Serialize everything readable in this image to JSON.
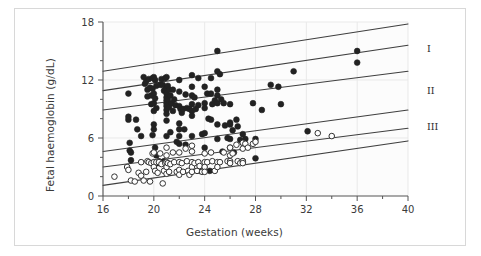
{
  "figure": {
    "border_color": "#d8d8d8",
    "plot_bg": "#fcfcfc",
    "axis_color": "#555555",
    "grid_color": "#e9e9e9",
    "line_color": "#3f3f3f",
    "filled_marker_color": "#222222",
    "open_marker_stroke": "#333333"
  },
  "chart_data": {
    "type": "scatter",
    "title": "",
    "xlabel": "Gestation (weeks)",
    "ylabel": "Fetal haemoglobin (g/dL)",
    "xlim": [
      16,
      40
    ],
    "ylim": [
      0,
      18
    ],
    "xticks": [
      16,
      20,
      24,
      28,
      32,
      36,
      40
    ],
    "xtick_labels": [
      "16",
      "20",
      "24",
      "28",
      "32",
      "36",
      "40"
    ],
    "xminor_step": 2,
    "yticks": [
      0,
      6,
      12,
      18
    ],
    "ytick_labels": [
      "0",
      "6",
      "12",
      "18"
    ],
    "yminor_step": 2,
    "grid": "faint vertical at major x ticks, faint horizontal at major y ticks",
    "legend": "none",
    "annotations": [
      {
        "text": "I",
        "x": 40,
        "y": 15.2,
        "placement": "right-outside"
      },
      {
        "text": "II",
        "x": 40,
        "y": 10.9,
        "placement": "right-outside"
      },
      {
        "text": "III",
        "x": 40,
        "y": 7.2,
        "placement": "right-outside"
      }
    ],
    "reference_lines": [
      {
        "name": "band-I-upper",
        "x1": 16,
        "y1": 12.9,
        "x2": 40,
        "y2": 17.8
      },
      {
        "name": "band-I-lower",
        "x1": 16,
        "y1": 10.9,
        "x2": 40,
        "y2": 15.6
      },
      {
        "name": "band-II-upper",
        "x1": 16,
        "y1": 8.9,
        "x2": 40,
        "y2": 12.9
      },
      {
        "name": "band-II-lower",
        "x1": 16,
        "y1": 4.6,
        "x2": 40,
        "y2": 8.9
      },
      {
        "name": "band-III-upper",
        "x1": 16,
        "y1": 3.0,
        "x2": 40,
        "y2": 7.0
      },
      {
        "name": "band-III-lower",
        "x1": 16,
        "y1": 1.1,
        "x2": 40,
        "y2": 5.7
      }
    ],
    "series": [
      {
        "name": "filled",
        "marker": "filled-circle",
        "color": "#222222",
        "points": [
          [
            18.0,
            10.6
          ],
          [
            18.0,
            7.9
          ],
          [
            18.0,
            8.2
          ],
          [
            18.1,
            5.5
          ],
          [
            18.1,
            4.7
          ],
          [
            18.2,
            4.5
          ],
          [
            18.2,
            3.7
          ],
          [
            18.6,
            7.9
          ],
          [
            18.7,
            6.9
          ],
          [
            19.0,
            6.2
          ],
          [
            19.2,
            12.3
          ],
          [
            19.3,
            11.6
          ],
          [
            19.4,
            11.9
          ],
          [
            19.5,
            11.0
          ],
          [
            19.5,
            10.3
          ],
          [
            19.6,
            12.1
          ],
          [
            19.7,
            11.2
          ],
          [
            19.8,
            10.4
          ],
          [
            19.8,
            9.5
          ],
          [
            19.9,
            12.2
          ],
          [
            19.9,
            11.1
          ],
          [
            19.9,
            6.3
          ],
          [
            20.0,
            12.3
          ],
          [
            20.0,
            10.6
          ],
          [
            20.0,
            9.6
          ],
          [
            20.0,
            8.8
          ],
          [
            20.0,
            7.4
          ],
          [
            20.0,
            6.9
          ],
          [
            20.1,
            12.0
          ],
          [
            20.1,
            10.1
          ],
          [
            20.1,
            5.0
          ],
          [
            20.2,
            11.4
          ],
          [
            20.2,
            9.1
          ],
          [
            20.2,
            4.2
          ],
          [
            20.3,
            3.4
          ],
          [
            20.4,
            3.6
          ],
          [
            20.5,
            11.5
          ],
          [
            20.5,
            3.4
          ],
          [
            20.6,
            12.1
          ],
          [
            20.7,
            11.5
          ],
          [
            20.8,
            10.9
          ],
          [
            20.8,
            3.6
          ],
          [
            20.9,
            12.2
          ],
          [
            20.9,
            11.0
          ],
          [
            21.0,
            12.3
          ],
          [
            21.0,
            11.1
          ],
          [
            21.0,
            10.6
          ],
          [
            21.0,
            10.2
          ],
          [
            21.0,
            9.9
          ],
          [
            21.0,
            9.6
          ],
          [
            21.0,
            9.3
          ],
          [
            21.0,
            8.9
          ],
          [
            21.0,
            8.5
          ],
          [
            21.0,
            7.8
          ],
          [
            21.0,
            6.2
          ],
          [
            21.1,
            11.4
          ],
          [
            21.1,
            10.0
          ],
          [
            21.2,
            11.0
          ],
          [
            21.2,
            9.2
          ],
          [
            21.3,
            10.4
          ],
          [
            21.3,
            6.6
          ],
          [
            21.4,
            9.6
          ],
          [
            21.5,
            11.0
          ],
          [
            21.5,
            8.8
          ],
          [
            21.6,
            10.0
          ],
          [
            21.7,
            9.4
          ],
          [
            21.8,
            5.6
          ],
          [
            22.0,
            12.0
          ],
          [
            22.0,
            10.8
          ],
          [
            22.0,
            9.3
          ],
          [
            22.0,
            7.5
          ],
          [
            22.0,
            6.9
          ],
          [
            22.0,
            6.2
          ],
          [
            22.0,
            5.4
          ],
          [
            22.1,
            9.0
          ],
          [
            22.2,
            8.6
          ],
          [
            22.3,
            9.0
          ],
          [
            22.4,
            6.9
          ],
          [
            22.5,
            10.5
          ],
          [
            22.5,
            5.3
          ],
          [
            22.6,
            9.1
          ],
          [
            22.8,
            9.0
          ],
          [
            23.0,
            12.5
          ],
          [
            23.0,
            11.3
          ],
          [
            23.0,
            10.4
          ],
          [
            23.0,
            9.5
          ],
          [
            23.0,
            8.8
          ],
          [
            23.0,
            8.3
          ],
          [
            23.0,
            6.2
          ],
          [
            23.2,
            10.2
          ],
          [
            23.3,
            9.0
          ],
          [
            23.5,
            12.2
          ],
          [
            23.5,
            9.4
          ],
          [
            23.6,
            2.6
          ],
          [
            23.8,
            6.4
          ],
          [
            24.0,
            11.3
          ],
          [
            24.0,
            9.6
          ],
          [
            24.0,
            9.1
          ],
          [
            24.0,
            6.5
          ],
          [
            24.0,
            5.0
          ],
          [
            24.2,
            10.6
          ],
          [
            24.3,
            8.0
          ],
          [
            24.4,
            2.6
          ],
          [
            24.5,
            12.2
          ],
          [
            24.5,
            10.6
          ],
          [
            24.5,
            7.9
          ],
          [
            24.6,
            9.5
          ],
          [
            24.8,
            9.9
          ],
          [
            25.0,
            15.0
          ],
          [
            25.0,
            12.9
          ],
          [
            25.0,
            11.0
          ],
          [
            25.0,
            10.4
          ],
          [
            25.0,
            9.6
          ],
          [
            25.0,
            7.4
          ],
          [
            25.0,
            5.9
          ],
          [
            25.2,
            12.6
          ],
          [
            25.3,
            10.0
          ],
          [
            25.4,
            4.6
          ],
          [
            25.5,
            9.6
          ],
          [
            25.6,
            7.3
          ],
          [
            25.8,
            6.0
          ],
          [
            26.0,
            9.5
          ],
          [
            26.0,
            7.6
          ],
          [
            26.0,
            7.4
          ],
          [
            26.0,
            5.9
          ],
          [
            26.0,
            5.0
          ],
          [
            26.2,
            6.8
          ],
          [
            26.3,
            4.5
          ],
          [
            26.5,
            7.9
          ],
          [
            26.6,
            7.2
          ],
          [
            26.8,
            5.8
          ],
          [
            27.0,
            6.4
          ],
          [
            27.0,
            5.5
          ],
          [
            27.0,
            3.6
          ],
          [
            27.0,
            3.5
          ],
          [
            27.2,
            5.9
          ],
          [
            27.8,
            9.6
          ],
          [
            28.0,
            5.9
          ],
          [
            28.0,
            3.9
          ],
          [
            28.5,
            8.9
          ],
          [
            29.2,
            11.5
          ],
          [
            29.8,
            11.3
          ],
          [
            30.0,
            9.5
          ],
          [
            31.0,
            12.9
          ],
          [
            32.1,
            6.7
          ],
          [
            36.0,
            15.0
          ],
          [
            36.0,
            13.8
          ]
        ]
      },
      {
        "name": "open",
        "marker": "open-circle",
        "color": "#ffffff",
        "points": [
          [
            16.9,
            2.0
          ],
          [
            17.9,
            3.0
          ],
          [
            18.0,
            2.7
          ],
          [
            18.2,
            1.6
          ],
          [
            18.5,
            1.5
          ],
          [
            18.8,
            2.4
          ],
          [
            19.0,
            3.5
          ],
          [
            19.0,
            2.1
          ],
          [
            19.2,
            1.6
          ],
          [
            19.4,
            2.5
          ],
          [
            19.5,
            3.6
          ],
          [
            19.6,
            3.5
          ],
          [
            19.7,
            1.5
          ],
          [
            19.8,
            3.4
          ],
          [
            19.9,
            4.4
          ],
          [
            20.0,
            4.5
          ],
          [
            20.0,
            3.5
          ],
          [
            20.0,
            3.0
          ],
          [
            20.1,
            2.6
          ],
          [
            20.2,
            3.5
          ],
          [
            20.3,
            2.4
          ],
          [
            20.4,
            3.5
          ],
          [
            20.5,
            4.4
          ],
          [
            20.6,
            3.3
          ],
          [
            20.7,
            1.3
          ],
          [
            20.8,
            2.6
          ],
          [
            20.9,
            3.4
          ],
          [
            21.0,
            5.0
          ],
          [
            21.0,
            4.2
          ],
          [
            21.0,
            3.5
          ],
          [
            21.0,
            3.0
          ],
          [
            21.0,
            2.3
          ],
          [
            21.1,
            3.4
          ],
          [
            21.2,
            2.5
          ],
          [
            21.3,
            3.3
          ],
          [
            21.5,
            4.5
          ],
          [
            21.6,
            3.5
          ],
          [
            21.8,
            2.5
          ],
          [
            22.0,
            4.5
          ],
          [
            22.0,
            3.5
          ],
          [
            22.0,
            2.7
          ],
          [
            22.0,
            2.2
          ],
          [
            22.2,
            3.4
          ],
          [
            22.3,
            2.5
          ],
          [
            22.5,
            4.9
          ],
          [
            22.6,
            3.6
          ],
          [
            22.7,
            2.6
          ],
          [
            22.8,
            2.2
          ],
          [
            23.0,
            5.2
          ],
          [
            23.0,
            4.6
          ],
          [
            23.0,
            3.5
          ],
          [
            23.0,
            3.0
          ],
          [
            23.0,
            2.5
          ],
          [
            23.2,
            3.4
          ],
          [
            23.4,
            2.6
          ],
          [
            23.5,
            3.5
          ],
          [
            23.6,
            3.1
          ],
          [
            23.8,
            2.5
          ],
          [
            24.0,
            4.4
          ],
          [
            24.0,
            3.5
          ],
          [
            24.0,
            3.0
          ],
          [
            24.0,
            2.5
          ],
          [
            24.2,
            3.5
          ],
          [
            24.5,
            4.5
          ],
          [
            24.6,
            3.6
          ],
          [
            24.8,
            2.6
          ],
          [
            25.0,
            3.5
          ],
          [
            25.0,
            3.0
          ],
          [
            25.2,
            3.5
          ],
          [
            25.5,
            4.5
          ],
          [
            25.8,
            3.6
          ],
          [
            26.0,
            5.0
          ],
          [
            26.0,
            4.2
          ],
          [
            26.0,
            3.6
          ],
          [
            26.0,
            3.4
          ],
          [
            26.2,
            4.4
          ],
          [
            26.5,
            5.3
          ],
          [
            26.6,
            3.6
          ],
          [
            26.8,
            3.4
          ],
          [
            27.0,
            5.5
          ],
          [
            27.0,
            4.9
          ],
          [
            27.0,
            3.6
          ],
          [
            27.0,
            3.4
          ],
          [
            27.2,
            5.4
          ],
          [
            27.4,
            5.0
          ],
          [
            27.8,
            5.4
          ],
          [
            28.0,
            5.6
          ],
          [
            32.9,
            6.5
          ],
          [
            34.0,
            6.2
          ]
        ]
      }
    ]
  }
}
